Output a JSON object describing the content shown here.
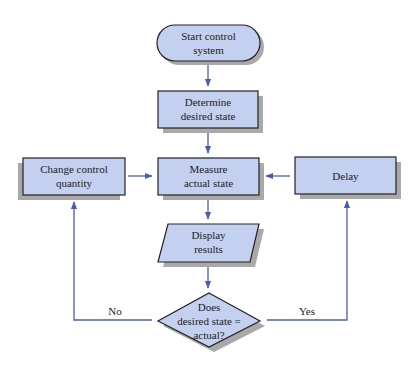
{
  "diagram": {
    "type": "flowchart",
    "colors": {
      "node_fill": "#c4d0ef",
      "node_stroke": "#222222",
      "shadow": "#a9a9a9",
      "connector": "#4a5db0",
      "text": "#222222"
    },
    "nodes": {
      "start": {
        "shape": "terminator",
        "line1": "Start control",
        "line2": "system"
      },
      "determine": {
        "shape": "process",
        "line1": "Determine",
        "line2": "desired state"
      },
      "measure": {
        "shape": "process",
        "line1": "Measure",
        "line2": "actual state"
      },
      "change": {
        "shape": "process",
        "line1": "Change control",
        "line2": "quantity"
      },
      "delay": {
        "shape": "process",
        "line1": "Delay"
      },
      "display": {
        "shape": "input-output",
        "line1": "Display",
        "line2": "results"
      },
      "decision": {
        "shape": "decision",
        "line1": "Does",
        "line2": "desired state =",
        "line3": "actual?"
      }
    },
    "edges": [
      {
        "from": "start",
        "to": "determine"
      },
      {
        "from": "determine",
        "to": "measure"
      },
      {
        "from": "change",
        "to": "measure"
      },
      {
        "from": "delay",
        "to": "measure"
      },
      {
        "from": "measure",
        "to": "display"
      },
      {
        "from": "display",
        "to": "decision"
      },
      {
        "from": "decision",
        "to": "change",
        "label": "No"
      },
      {
        "from": "decision",
        "to": "delay",
        "label": "Yes"
      }
    ],
    "edge_labels": {
      "no": "No",
      "yes": "Yes"
    }
  }
}
